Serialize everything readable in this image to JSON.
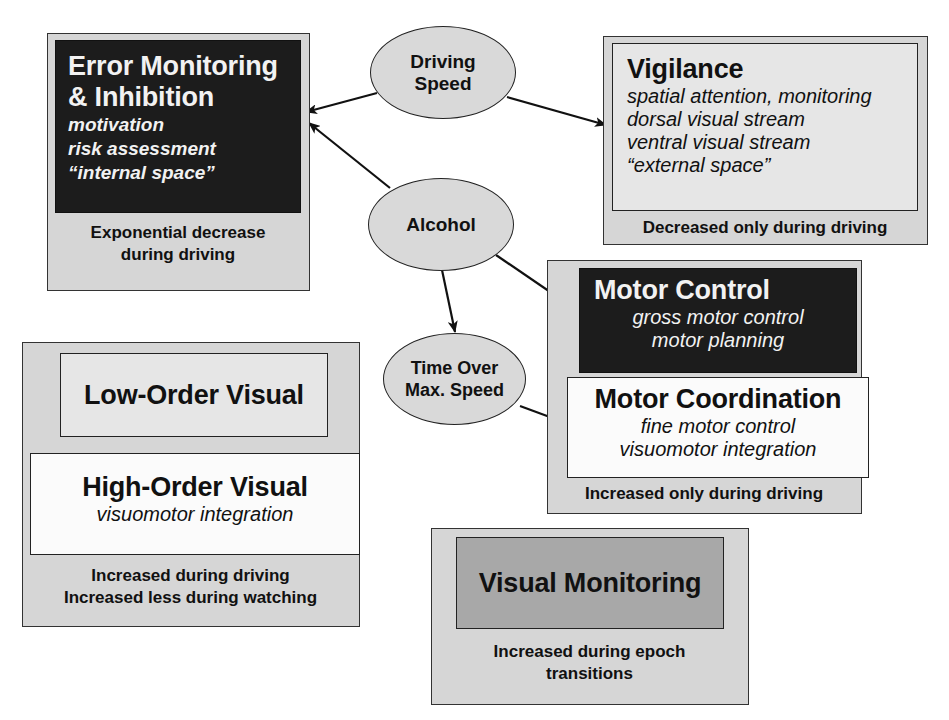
{
  "diagram": {
    "type": "flow-diagram",
    "factors": {
      "driving_speed": {
        "label_line1": "Driving",
        "label_line2": "Speed"
      },
      "alcohol": {
        "label": "Alcohol"
      },
      "time_over_max_speed": {
        "label_line1": "Time Over",
        "label_line2": "Max. Speed"
      }
    },
    "error_monitoring": {
      "title_line1": "Error Monitoring",
      "title_line2": "& Inhibition",
      "items": [
        "motivation",
        "risk assessment",
        "“internal space”"
      ],
      "caption_line1": "Exponential decrease",
      "caption_line2": "during driving"
    },
    "vigilance": {
      "title": "Vigilance",
      "items": [
        "spatial attention, monitoring",
        "dorsal visual stream",
        "ventral visual stream",
        "“external space”"
      ],
      "caption": "Decreased only during driving"
    },
    "motor": {
      "control_title": "Motor Control",
      "control_items": [
        "gross motor control",
        "motor planning"
      ],
      "coordination_title": "Motor Coordination",
      "coordination_items": [
        "fine motor control",
        "visuomotor integration"
      ],
      "caption": "Increased only during driving"
    },
    "visual": {
      "low_order_title": "Low-Order Visual",
      "high_order_title": "High-Order Visual",
      "high_order_items": [
        "visuomotor integration"
      ],
      "caption_line1": "Increased during driving",
      "caption_line2": "Increased less during watching"
    },
    "visual_monitoring": {
      "title": "Visual Monitoring",
      "caption_line1": "Increased during epoch",
      "caption_line2": "transitions"
    },
    "edges": [
      {
        "from": "Driving Speed",
        "to": "Error Monitoring & Inhibition"
      },
      {
        "from": "Driving Speed",
        "to": "Vigilance"
      },
      {
        "from": "Alcohol",
        "to": "Error Monitoring & Inhibition"
      },
      {
        "from": "Alcohol",
        "to": "Motor Control"
      },
      {
        "from": "Alcohol",
        "to": "Time Over Max. Speed"
      },
      {
        "from": "Time Over Max. Speed",
        "to": "Motor Coordination"
      }
    ],
    "colors": {
      "outer_box": "#d6d6d6",
      "dark_box": "#1c1c1c",
      "light_box": "#e6e6e6",
      "white_box": "#fbfbfb",
      "mid_box": "#a8a8a8",
      "ellipse": "#d9d9d9",
      "line": "#111111"
    }
  }
}
